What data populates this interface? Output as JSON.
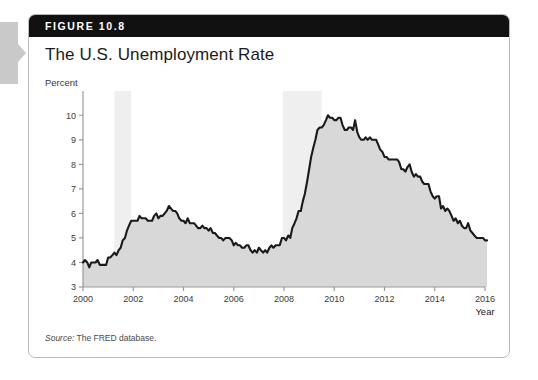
{
  "figure": {
    "header_label": "FIGURE 10.8",
    "title": "The U.S. Unemployment Rate",
    "source_prefix": "Source:",
    "source_text": "The FRED database."
  },
  "colors": {
    "header_bar": "#111111",
    "card_border": "#b9b9b9",
    "line": "#1a1a1a",
    "area_fill": "#d8d8d8",
    "recession_band": "#efefef",
    "axis": "#9a9a9a",
    "tab": "#c9c9c9"
  },
  "chart_data": {
    "type": "line",
    "title": "The U.S. Unemployment Rate",
    "xlabel": "Year",
    "ylabel": "Percent",
    "ylim": [
      3,
      10.5
    ],
    "xlim": [
      2000,
      2016
    ],
    "grid": false,
    "legend": null,
    "yticks": [
      3,
      4,
      5,
      6,
      7,
      8,
      9,
      10
    ],
    "ytick_labels": [
      "3",
      "4",
      "5",
      "6",
      "7",
      "8",
      "9",
      "10"
    ],
    "xticks": [
      2000,
      2002,
      2004,
      2006,
      2008,
      2010,
      2012,
      2014,
      2016
    ],
    "xtick_labels": [
      "2000",
      "2002",
      "2004",
      "2006",
      "2008",
      "2010",
      "2012",
      "2014",
      "2016"
    ],
    "shaded_regions": [
      {
        "label": "recession",
        "x0": 2001.25,
        "x1": 2001.92
      },
      {
        "label": "recession",
        "x0": 2007.95,
        "x1": 2009.5
      }
    ],
    "series": [
      {
        "name": "Unemployment rate",
        "x": [
          2000.0,
          2000.08,
          2000.17,
          2000.25,
          2000.33,
          2000.42,
          2000.5,
          2000.58,
          2000.67,
          2000.75,
          2000.83,
          2000.92,
          2001.0,
          2001.08,
          2001.17,
          2001.25,
          2001.33,
          2001.42,
          2001.5,
          2001.58,
          2001.67,
          2001.75,
          2001.83,
          2001.92,
          2002.0,
          2002.08,
          2002.17,
          2002.25,
          2002.33,
          2002.42,
          2002.5,
          2002.58,
          2002.67,
          2002.75,
          2002.83,
          2002.92,
          2003.0,
          2003.08,
          2003.17,
          2003.25,
          2003.33,
          2003.42,
          2003.5,
          2003.58,
          2003.67,
          2003.75,
          2003.83,
          2003.92,
          2004.0,
          2004.08,
          2004.17,
          2004.25,
          2004.33,
          2004.42,
          2004.5,
          2004.58,
          2004.67,
          2004.75,
          2004.83,
          2004.92,
          2005.0,
          2005.08,
          2005.17,
          2005.25,
          2005.33,
          2005.42,
          2005.5,
          2005.58,
          2005.67,
          2005.75,
          2005.83,
          2005.92,
          2006.0,
          2006.08,
          2006.17,
          2006.25,
          2006.33,
          2006.42,
          2006.5,
          2006.58,
          2006.67,
          2006.75,
          2006.83,
          2006.92,
          2007.0,
          2007.08,
          2007.17,
          2007.25,
          2007.33,
          2007.42,
          2007.5,
          2007.58,
          2007.67,
          2007.75,
          2007.83,
          2007.92,
          2008.0,
          2008.08,
          2008.17,
          2008.25,
          2008.33,
          2008.42,
          2008.5,
          2008.58,
          2008.67,
          2008.75,
          2008.83,
          2008.92,
          2009.0,
          2009.08,
          2009.17,
          2009.25,
          2009.33,
          2009.42,
          2009.5,
          2009.58,
          2009.67,
          2009.75,
          2009.83,
          2009.92,
          2010.0,
          2010.08,
          2010.17,
          2010.25,
          2010.33,
          2010.42,
          2010.5,
          2010.58,
          2010.67,
          2010.75,
          2010.83,
          2010.92,
          2011.0,
          2011.08,
          2011.17,
          2011.25,
          2011.33,
          2011.42,
          2011.5,
          2011.58,
          2011.67,
          2011.75,
          2011.83,
          2011.92,
          2012.0,
          2012.08,
          2012.17,
          2012.25,
          2012.33,
          2012.42,
          2012.5,
          2012.58,
          2012.67,
          2012.75,
          2012.83,
          2012.92,
          2013.0,
          2013.08,
          2013.17,
          2013.25,
          2013.33,
          2013.42,
          2013.5,
          2013.58,
          2013.67,
          2013.75,
          2013.83,
          2013.92,
          2014.0,
          2014.08,
          2014.17,
          2014.25,
          2014.33,
          2014.42,
          2014.5,
          2014.58,
          2014.67,
          2014.75,
          2014.83,
          2014.92,
          2015.0,
          2015.08,
          2015.17,
          2015.25,
          2015.33,
          2015.42,
          2015.5,
          2015.58,
          2015.67,
          2015.75,
          2015.83,
          2015.92,
          2016.0,
          2016.08
        ],
        "values": [
          4.0,
          4.1,
          4.0,
          3.8,
          4.0,
          4.0,
          4.0,
          4.1,
          3.9,
          3.9,
          3.9,
          3.9,
          4.2,
          4.2,
          4.3,
          4.4,
          4.3,
          4.5,
          4.6,
          4.9,
          5.0,
          5.3,
          5.5,
          5.7,
          5.7,
          5.7,
          5.7,
          5.9,
          5.8,
          5.8,
          5.8,
          5.7,
          5.7,
          5.7,
          5.9,
          6.0,
          5.8,
          5.9,
          5.9,
          6.0,
          6.1,
          6.3,
          6.2,
          6.1,
          6.1,
          6.0,
          5.8,
          5.7,
          5.7,
          5.6,
          5.8,
          5.6,
          5.6,
          5.6,
          5.5,
          5.4,
          5.4,
          5.5,
          5.4,
          5.4,
          5.3,
          5.4,
          5.2,
          5.2,
          5.1,
          5.0,
          5.0,
          4.9,
          5.0,
          5.0,
          5.0,
          4.9,
          4.7,
          4.8,
          4.7,
          4.7,
          4.6,
          4.6,
          4.7,
          4.7,
          4.5,
          4.4,
          4.5,
          4.4,
          4.6,
          4.5,
          4.4,
          4.5,
          4.4,
          4.6,
          4.7,
          4.6,
          4.7,
          4.7,
          4.7,
          5.0,
          5.0,
          4.9,
          5.1,
          5.0,
          5.4,
          5.6,
          5.8,
          6.1,
          6.1,
          6.5,
          6.8,
          7.3,
          7.8,
          8.3,
          8.7,
          9.0,
          9.4,
          9.5,
          9.5,
          9.6,
          9.8,
          10.0,
          9.9,
          9.9,
          9.8,
          9.8,
          9.9,
          9.9,
          9.6,
          9.4,
          9.4,
          9.5,
          9.5,
          9.4,
          9.8,
          9.3,
          9.1,
          9.0,
          9.0,
          9.1,
          9.0,
          9.1,
          9.0,
          9.0,
          9.0,
          8.8,
          8.6,
          8.5,
          8.3,
          8.3,
          8.2,
          8.2,
          8.2,
          8.2,
          8.2,
          8.1,
          7.8,
          7.8,
          7.7,
          7.9,
          8.0,
          7.7,
          7.5,
          7.6,
          7.5,
          7.5,
          7.3,
          7.2,
          7.2,
          7.2,
          6.9,
          6.7,
          6.6,
          6.7,
          6.7,
          6.2,
          6.3,
          6.1,
          6.2,
          6.1,
          5.9,
          5.7,
          5.8,
          5.6,
          5.7,
          5.5,
          5.4,
          5.4,
          5.6,
          5.3,
          5.2,
          5.1,
          5.0,
          5.0,
          5.0,
          5.0,
          4.9,
          4.9
        ]
      }
    ]
  }
}
